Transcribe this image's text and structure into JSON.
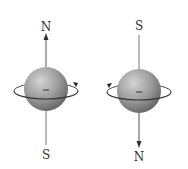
{
  "diagram": {
    "type": "spinning-charge-magnetic-moment",
    "spins": [
      {
        "id": "left",
        "top_label": "N",
        "bottom_label": "S",
        "arrow_direction": "up",
        "rotation": "counterclockwise-viewed-from-top",
        "charge_sign": "−"
      },
      {
        "id": "right",
        "top_label": "S",
        "bottom_label": "N",
        "arrow_direction": "down",
        "rotation": "clockwise-viewed-from-top",
        "charge_sign": "−"
      }
    ],
    "colors": {
      "sphere_light": "#c8c8c8",
      "sphere_dark": "#6e6e6e",
      "axis": "#555555",
      "label": "#333333"
    }
  }
}
